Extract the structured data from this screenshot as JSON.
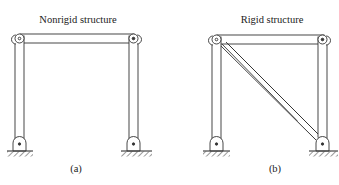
{
  "figure": {
    "panels": [
      {
        "id": "a",
        "title": "Nonrigid structure",
        "label": "(a)",
        "members": [
          "left-column",
          "right-column",
          "top-beam"
        ],
        "joints": [
          "top-left-pin",
          "top-right-pin",
          "base-left-pin",
          "base-right-pin"
        ],
        "supports": [
          "left-pinned-support",
          "right-pinned-support"
        ]
      },
      {
        "id": "b",
        "title": "Rigid structure",
        "label": "(b)",
        "members": [
          "left-column",
          "right-column",
          "top-beam",
          "diagonal-brace"
        ],
        "joints": [
          "top-left-pin",
          "top-right-pin",
          "base-left-pin",
          "base-right-pin"
        ],
        "supports": [
          "left-pinned-support",
          "right-pinned-support"
        ]
      }
    ],
    "colors": {
      "line": "#333333",
      "background": "#ffffff"
    }
  }
}
